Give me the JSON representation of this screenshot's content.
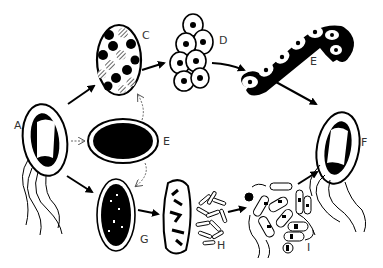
{
  "diagram": {
    "type": "life-cycle",
    "background": "#ffffff",
    "ink_color": "#000000",
    "label_color": "#333333",
    "stages": [
      {
        "id": "A",
        "label": "A",
        "description": "flagellated cell with dark polar regions"
      },
      {
        "id": "C",
        "label": "C",
        "description": "oval body filled with mixed dark and hatched granules"
      },
      {
        "id": "D",
        "label": "D",
        "description": "cluster of nucleated cells"
      },
      {
        "id": "E",
        "label": "E",
        "description": "chain of nucleated cells"
      },
      {
        "id": "F",
        "label": "F",
        "description": "flagellated cell with dark polar regions"
      },
      {
        "id": "B",
        "label": "E",
        "description": "central dark oval (resting form)"
      },
      {
        "id": "G",
        "label": "G",
        "description": "oval body densely filled with dark granules"
      },
      {
        "id": "H",
        "label": "H",
        "description": "cell with dark fragments releasing rod-shaped bodies"
      },
      {
        "id": "I",
        "label": "I",
        "description": "mass of banded rods and filaments"
      }
    ],
    "arrows": [
      {
        "from": "A",
        "to": "C",
        "style": "solid"
      },
      {
        "from": "C",
        "to": "D",
        "style": "solid"
      },
      {
        "from": "D",
        "to": "E",
        "style": "solid"
      },
      {
        "from": "E",
        "to": "F",
        "style": "solid"
      },
      {
        "from": "A",
        "to": "G",
        "style": "solid"
      },
      {
        "from": "G",
        "to": "H",
        "style": "solid"
      },
      {
        "from": "H",
        "to": "I",
        "style": "solid"
      },
      {
        "from": "I",
        "to": "F",
        "style": "solid"
      },
      {
        "from": "B",
        "to": "C",
        "style": "dashed"
      },
      {
        "from": "B",
        "to": "G",
        "style": "dashed"
      },
      {
        "from": "A",
        "to": "B",
        "style": "dashed"
      }
    ]
  }
}
